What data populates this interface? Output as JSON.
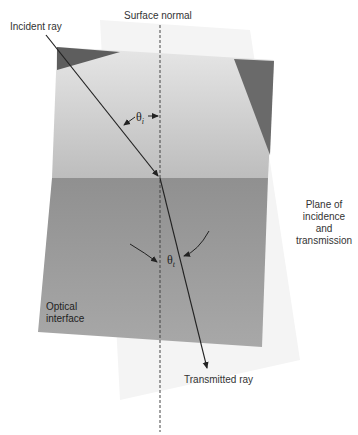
{
  "labels": {
    "surface_normal": "Surface normal",
    "incident_ray": "Incident ray",
    "transmitted_ray": "Transmitted ray",
    "plane_line1": "Plane of",
    "plane_line2": "incidence",
    "plane_line3": "and",
    "plane_line4": "transmission",
    "interface_line1": "Optical",
    "interface_line2": "interface",
    "theta_i_symbol": "θ",
    "theta_i_sub": "i",
    "theta_t_symbol": "θ",
    "theta_t_sub": "t"
  },
  "colors": {
    "upper_medium": "#c9c9c9",
    "lower_medium": "#9a9a9a",
    "dark_facet": "#6a6a6a",
    "ghost_plane": "#f3f3f3",
    "ray": "#222222"
  }
}
